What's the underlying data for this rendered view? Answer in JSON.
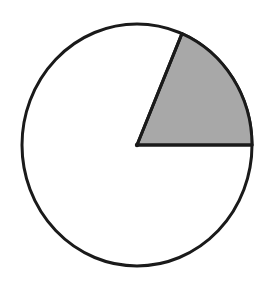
{
  "figure": {
    "type": "pie-sector-diagram",
    "background_color": "#ffffff"
  },
  "chart_data": {
    "type": "pie",
    "title": "",
    "subtitle": "",
    "xlabel": "",
    "ylabel": "",
    "legend_position": "none",
    "grid": false,
    "labels_shown": false,
    "categories": [
      "Shaded sector",
      "Unshaded remainder"
    ],
    "values": [
      18.6,
      81.4
    ],
    "angles_deg": [
      67,
      293
    ],
    "colors": [
      "#a8a8a8",
      "#ffffff"
    ],
    "start_angle_deg": 0,
    "direction": "counterclockwise",
    "annotations": []
  },
  "geometry": {
    "center_x": 137,
    "center_y": 145,
    "radius_x": 115,
    "radius_y": 121,
    "stroke_color": "#1a1a1a",
    "stroke_width": 3,
    "sector_fill": "#a8a8a8",
    "circle_fill": "#ffffff",
    "sector_start_angle_deg": 0,
    "sector_end_angle_deg": 67,
    "radius_horizontal_end_x": 252,
    "radius_horizontal_end_y": 145,
    "radius_slanted_end_x": 187,
    "radius_slanted_end_y": 31
  }
}
